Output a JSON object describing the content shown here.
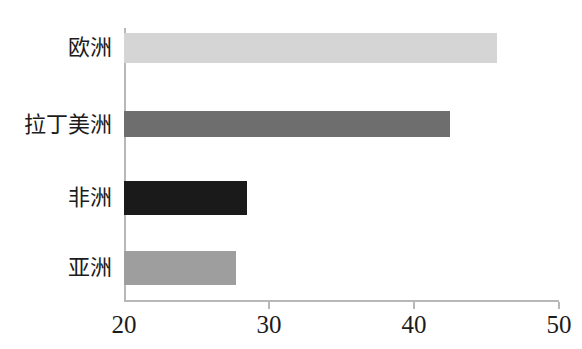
{
  "chart_data": {
    "type": "bar",
    "orientation": "horizontal",
    "title": "",
    "subtitle": "",
    "xlabel": "",
    "ylabel": "",
    "categories": [
      "欧洲",
      "拉丁美洲",
      "非洲",
      "亚洲"
    ],
    "values": [
      45.7,
      42.5,
      28.5,
      27.7
    ],
    "series": [
      {
        "name": "",
        "values": [
          45.7,
          42.5,
          28.5,
          27.7
        ]
      }
    ],
    "bar_colors": [
      "#d5d5d5",
      "#6e6e6e",
      "#1a1a1a",
      "#9e9e9e"
    ],
    "xlim": [
      20,
      50
    ],
    "xticks": [
      20,
      30,
      40,
      50
    ],
    "xtick_labels": [
      "20",
      "30",
      "40",
      "50"
    ],
    "grid": false,
    "legend": false,
    "legend_position": "none",
    "axis_color": "#b8b8b8",
    "text_color": "#1c1c1c",
    "background": "#ffffff"
  },
  "layout": {
    "plot_left_px": 124,
    "plot_right_px": 559,
    "axis_bottom_px": 300,
    "axis_top_px": 28,
    "bar_tops_px": [
      33,
      111,
      181,
      251
    ],
    "bar_heights_px": [
      30,
      26,
      34,
      34
    ],
    "label_right_px": 112,
    "label_centers_px": [
      48,
      125,
      198,
      268
    ],
    "tick_label_y_px": 312
  }
}
